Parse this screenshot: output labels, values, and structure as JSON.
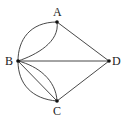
{
  "diagram": {
    "type": "multigraph",
    "nodes": [
      {
        "id": "A",
        "label": "A",
        "x": 57,
        "y": 22
      },
      {
        "id": "B",
        "label": "B",
        "x": 18,
        "y": 61
      },
      {
        "id": "C",
        "label": "C",
        "x": 57,
        "y": 101
      },
      {
        "id": "D",
        "label": "D",
        "x": 109,
        "y": 61
      }
    ],
    "edges": [
      {
        "from": "A",
        "to": "B",
        "style": "outer-arc"
      },
      {
        "from": "A",
        "to": "B",
        "style": "inner-arc"
      },
      {
        "from": "A",
        "to": "D",
        "style": "straight"
      },
      {
        "from": "B",
        "to": "D",
        "style": "straight"
      },
      {
        "from": "B",
        "to": "C",
        "style": "outer-arc"
      },
      {
        "from": "B",
        "to": "C",
        "style": "straight"
      },
      {
        "from": "B",
        "to": "C",
        "style": "inner-arc"
      },
      {
        "from": "C",
        "to": "D",
        "style": "straight"
      }
    ],
    "colors": {
      "stroke": "#333333",
      "node": "#111111",
      "background": "#ffffff"
    }
  }
}
